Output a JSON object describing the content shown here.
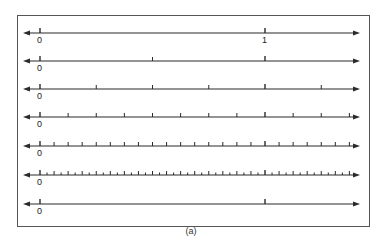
{
  "figure": {
    "caption": "(a)",
    "colors": {
      "line": "#2a2a2a",
      "frame": "#555555",
      "background": "#ffffff"
    }
  },
  "number_lines": [
    {
      "id": "line-1",
      "divisions": 1,
      "labels": [
        "0",
        "1"
      ],
      "show_one_label": true
    },
    {
      "id": "line-2",
      "divisions": 2,
      "labels": [
        "0"
      ],
      "show_one_label": false
    },
    {
      "id": "line-3",
      "divisions": 4,
      "labels": [
        "0"
      ],
      "show_one_label": false
    },
    {
      "id": "line-4",
      "divisions": 8,
      "labels": [
        "0"
      ],
      "show_one_label": false
    },
    {
      "id": "line-5",
      "divisions": 16,
      "labels": [
        "0"
      ],
      "show_one_label": false
    },
    {
      "id": "line-6",
      "divisions": 32,
      "labels": [
        "0"
      ],
      "show_one_label": false
    },
    {
      "id": "line-7",
      "divisions": 1,
      "labels": [
        "0"
      ],
      "show_one_label": false
    }
  ],
  "labels": {
    "zero": "0",
    "one": "1"
  }
}
